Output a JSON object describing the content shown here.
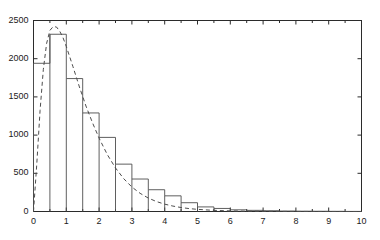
{
  "chart_data": {
    "type": "bar",
    "title": "",
    "subtitle": "",
    "xlabel": "",
    "ylabel": "",
    "xlim": [
      0,
      10
    ],
    "ylim": [
      0,
      2500
    ],
    "grid": false,
    "legend": null,
    "bin_width": 0.5,
    "x_ticks": [
      0,
      1,
      2,
      3,
      4,
      5,
      6,
      7,
      8,
      9,
      10
    ],
    "x_tick_labels": [
      "0",
      "1",
      "2",
      "3",
      "4",
      "5",
      "6",
      "7",
      "8",
      "9",
      "10"
    ],
    "x_minor_ticks": [
      0.5,
      1.5,
      2.5,
      3.5,
      4.5,
      5.5,
      6.5,
      7.5,
      8.5,
      9.5
    ],
    "y_ticks": [
      0,
      500,
      1000,
      1500,
      2000,
      2500
    ],
    "y_tick_labels": [
      "0",
      "500",
      "1000",
      "1500",
      "2000",
      "2500"
    ],
    "bin_edges": [
      0,
      0.5,
      1.0,
      1.5,
      2.0,
      2.5,
      3.0,
      3.5,
      4.0,
      4.5,
      5.0,
      5.5,
      6.0,
      6.5,
      7.0,
      7.5,
      8.0,
      8.5,
      9.0,
      9.5,
      10.0
    ],
    "categories": [
      "0-0.5",
      "0.5-1",
      "1-1.5",
      "1.5-2",
      "2-2.5",
      "2.5-3",
      "3-3.5",
      "3.5-4",
      "4-4.5",
      "4.5-5",
      "5-5.5",
      "5.5-6",
      "6-6.5",
      "6.5-7",
      "7-7.5",
      "7.5-8",
      "8-8.5",
      "8.5-9",
      "9-9.5",
      "9.5-10"
    ],
    "values": [
      1940,
      2320,
      1740,
      1290,
      970,
      620,
      425,
      285,
      205,
      115,
      60,
      40,
      22,
      15,
      10,
      6,
      4,
      3,
      2,
      1
    ],
    "series": [
      {
        "name": "histogram",
        "style": "step-outline",
        "color": "#4d4d4d",
        "values": [
          1940,
          2320,
          1740,
          1290,
          970,
          620,
          425,
          285,
          205,
          115,
          60,
          40,
          22,
          15,
          10,
          6,
          4,
          3,
          2,
          1
        ]
      },
      {
        "name": "fitted-density-curve",
        "style": "dashed",
        "color": "#4d4d4d",
        "x": [
          0,
          0.1,
          0.2,
          0.3,
          0.4,
          0.5,
          0.6,
          0.7,
          0.8,
          0.9,
          1.0,
          1.2,
          1.4,
          1.6,
          1.8,
          2.0,
          2.25,
          2.5,
          2.75,
          3.0,
          3.25,
          3.5,
          3.75,
          4.0,
          4.25,
          4.5,
          4.75,
          5.0,
          5.5,
          6.0,
          6.5,
          7.0,
          7.5,
          8.0,
          8.5,
          9.0,
          9.5,
          10.0
        ],
        "y": [
          0,
          620,
          1320,
          1860,
          2200,
          2370,
          2420,
          2415,
          2360,
          2275,
          2160,
          1900,
          1630,
          1380,
          1160,
          960,
          745,
          570,
          430,
          320,
          238,
          176,
          130,
          96,
          71,
          52,
          38,
          28,
          15,
          8,
          4.5,
          2.5,
          1.4,
          0.8,
          0.5,
          0.3,
          0.2,
          0.1
        ]
      }
    ],
    "colors": {
      "axis": "#2b2b2b",
      "bar_outline": "#4d4d4d",
      "curve": "#4d4d4d",
      "background": "#ffffff",
      "tick_label": "#1a1a1a"
    }
  }
}
